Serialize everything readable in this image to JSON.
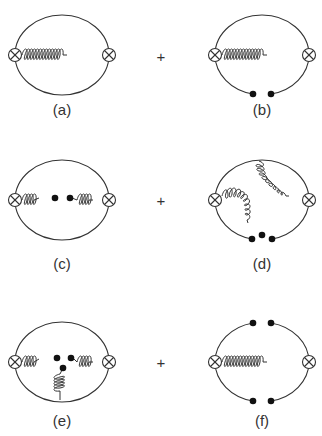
{
  "figure": {
    "panels": [
      {
        "id": "a",
        "label": "(a)",
        "description": "two-loop with gluon exchange between vertices"
      },
      {
        "id": "b",
        "label": "(b)",
        "description": "gluon exchange with two condensate dots on lower quark line"
      },
      {
        "id": "c",
        "label": "(c)",
        "description": "gluon condensate: gluon lines ending in dots at center"
      },
      {
        "id": "d",
        "label": "(d)",
        "description": "two gluons from quark lines ending at three dots at bottom"
      },
      {
        "id": "e",
        "label": "(e)",
        "description": "three gluon lines ending in three dots (triple gluon condensate)"
      },
      {
        "id": "f",
        "label": "(f)",
        "description": "gluon exchange with condensate dots on both upper and lower quark lines"
      }
    ],
    "operators": [
      "+",
      "+",
      "+"
    ],
    "colors": {
      "line": "#333333",
      "background": "#ffffff"
    }
  }
}
